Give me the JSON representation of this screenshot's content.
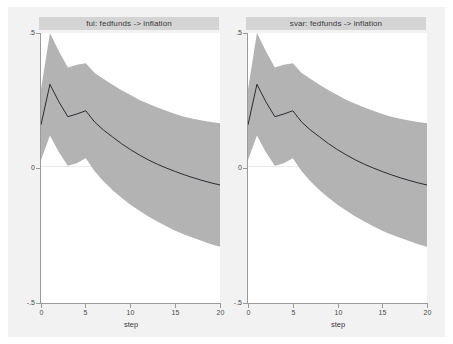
{
  "figure": {
    "background_color": "#ffffff",
    "inner_background_color": "#f2f2f2",
    "band_color": "#b3b3b3",
    "line_color": "#2b2b33",
    "title_bar_color": "#d4d4d4"
  },
  "panels": [
    {
      "title": "fui: fedfunds -> inflation",
      "xlabel": "step",
      "xticklabels": [
        "0",
        "5",
        "10",
        "15",
        "20"
      ],
      "yticklabels": [
        ".5",
        "0",
        "-.5"
      ]
    },
    {
      "title": "svar: fedfunds -> inflation",
      "xlabel": "step",
      "xticklabels": [
        "0",
        "5",
        "10",
        "15",
        "20"
      ],
      "yticklabels": [
        ".5",
        "0",
        "-.5"
      ]
    }
  ],
  "chart_data": {
    "type": "line",
    "title": "",
    "xlabel": "step",
    "ylabel": "",
    "xlim": [
      0,
      20
    ],
    "ylim": [
      -0.5,
      0.5
    ],
    "xticks": [
      0,
      5,
      10,
      15,
      20
    ],
    "yticks": [
      0.5,
      0,
      -0.5
    ],
    "grid": false,
    "legend": "none",
    "panels": [
      {
        "name": "fui: fedfunds -> inflation",
        "x": [
          0,
          1,
          2,
          3,
          4,
          5,
          6,
          7,
          8,
          9,
          10,
          11,
          12,
          13,
          14,
          15,
          16,
          17,
          18,
          19,
          20
        ],
        "series": [
          {
            "name": "irf",
            "values": [
              0.16,
              0.31,
              0.245,
              0.19,
              0.2,
              0.212,
              0.17,
              0.14,
              0.115,
              0.09,
              0.068,
              0.048,
              0.03,
              0.014,
              0.0,
              -0.013,
              -0.025,
              -0.036,
              -0.046,
              -0.055,
              -0.063
            ]
          },
          {
            "name": "ci_upper",
            "values": [
              0.292,
              0.5,
              0.432,
              0.372,
              0.382,
              0.388,
              0.352,
              0.33,
              0.308,
              0.288,
              0.27,
              0.252,
              0.238,
              0.224,
              0.212,
              0.2,
              0.19,
              0.182,
              0.176,
              0.17,
              0.166
            ]
          },
          {
            "name": "ci_lower",
            "values": [
              0.03,
              0.12,
              0.058,
              0.008,
              0.018,
              0.036,
              -0.012,
              -0.05,
              -0.082,
              -0.11,
              -0.136,
              -0.158,
              -0.18,
              -0.198,
              -0.216,
              -0.232,
              -0.246,
              -0.258,
              -0.27,
              -0.282,
              -0.292
            ]
          }
        ]
      },
      {
        "name": "svar: fedfunds -> inflation",
        "x": [
          0,
          1,
          2,
          3,
          4,
          5,
          6,
          7,
          8,
          9,
          10,
          11,
          12,
          13,
          14,
          15,
          16,
          17,
          18,
          19,
          20
        ],
        "series": [
          {
            "name": "irf",
            "values": [
              0.16,
              0.31,
              0.245,
              0.19,
              0.2,
              0.212,
              0.17,
              0.14,
              0.115,
              0.09,
              0.068,
              0.048,
              0.03,
              0.014,
              0.0,
              -0.013,
              -0.025,
              -0.036,
              -0.046,
              -0.055,
              -0.063
            ]
          },
          {
            "name": "ci_upper",
            "values": [
              0.292,
              0.5,
              0.432,
              0.372,
              0.382,
              0.388,
              0.352,
              0.33,
              0.308,
              0.288,
              0.27,
              0.252,
              0.238,
              0.224,
              0.212,
              0.2,
              0.19,
              0.182,
              0.176,
              0.17,
              0.166
            ]
          },
          {
            "name": "ci_lower",
            "values": [
              0.03,
              0.12,
              0.058,
              0.008,
              0.018,
              0.036,
              -0.012,
              -0.05,
              -0.082,
              -0.11,
              -0.136,
              -0.158,
              -0.18,
              -0.198,
              -0.216,
              -0.232,
              -0.246,
              -0.258,
              -0.27,
              -0.282,
              -0.292
            ]
          }
        ]
      }
    ]
  }
}
